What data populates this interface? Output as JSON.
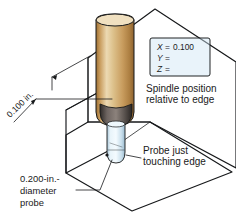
{
  "figure": {
    "colors": {
      "workpiece_top": "#c5dff0",
      "workpiece_front": "#8fc0e0",
      "workpiece_side": "#a8cfe8",
      "tool_light": "#e8d2a6",
      "tool_mid": "#c79a5b",
      "tool_dark": "#9c6f33",
      "collar_dark": "#4a4441",
      "probe_body": "#dff0f8",
      "outline": "#16181a",
      "text": "#1a1a1a",
      "page_background": "#ffffff"
    }
  },
  "readout": {
    "lines": [
      {
        "axis": "X",
        "equals": "=",
        "value": "0.100"
      },
      {
        "axis": "Y",
        "equals": "=",
        "value": ""
      },
      {
        "axis": "Z",
        "equals": "=",
        "value": ""
      }
    ]
  },
  "callouts": {
    "spindle_position": {
      "line1": "Spindle position",
      "line2": "relative to edge"
    },
    "probe_touching": {
      "line1": "Probe just",
      "line2": "touching edge"
    },
    "probe_diameter": {
      "line1": "0.200-in.-",
      "line2": "diameter",
      "line3": "probe"
    },
    "offset_dimension": {
      "label": "0.100 in."
    }
  }
}
